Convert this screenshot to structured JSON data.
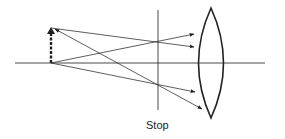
{
  "diagram": {
    "labels": {
      "stop": "Stop"
    },
    "elements": {
      "optical_axis": {
        "x1": 15,
        "y1": 63,
        "x2": 265,
        "y2": 63
      },
      "object_arrow": {
        "x": 51,
        "y_base": 63,
        "y_tip": 27,
        "style": "dashed-bold"
      },
      "stop_line": {
        "x": 158,
        "y1": 10,
        "y2": 110
      },
      "lens": {
        "type": "biconvex",
        "top": [
          211,
          8
        ],
        "bottom": [
          211,
          118
        ],
        "left_x": 193,
        "right_x": 229
      },
      "rays": [
        {
          "from": [
            51,
            28
          ],
          "to": [
            195,
            47
          ],
          "arrow_end": true
        },
        {
          "from": [
            51,
            63
          ],
          "to": [
            195,
            34
          ],
          "arrow_end": true
        },
        {
          "from": [
            51,
            63
          ],
          "to": [
            196,
            92
          ],
          "arrow_end": true
        },
        {
          "from": [
            203,
            109
          ],
          "to": [
            55,
            29
          ],
          "arrow_end": true,
          "note": "ray from object top through stop to lens bottom edge"
        }
      ]
    },
    "colors": {
      "line": "#222222",
      "background": "#ffffff"
    }
  }
}
